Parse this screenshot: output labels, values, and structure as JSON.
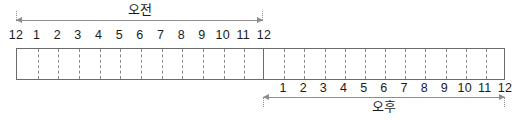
{
  "chart_data": {
    "type": "table",
    "title": "",
    "periods": [
      {
        "id": "am",
        "caption": "오전",
        "caption_meaning": "AM",
        "label_position": "above",
        "tick_labels": [
          "12",
          "1",
          "2",
          "3",
          "4",
          "5",
          "6",
          "7",
          "8",
          "9",
          "10",
          "11",
          "12"
        ],
        "segments": 12
      },
      {
        "id": "pm",
        "caption": "오후",
        "caption_meaning": "PM",
        "label_position": "below",
        "tick_labels": [
          "12",
          "1",
          "2",
          "3",
          "4",
          "5",
          "6",
          "7",
          "8",
          "9",
          "10",
          "11",
          "12"
        ],
        "segments": 12
      }
    ],
    "colors": {
      "bar_border": "#6b6b6b",
      "divider": "#8a8a8a",
      "arrow": "#8d8d8d",
      "text": "#1a1a1a",
      "background": "#ffffff"
    }
  }
}
